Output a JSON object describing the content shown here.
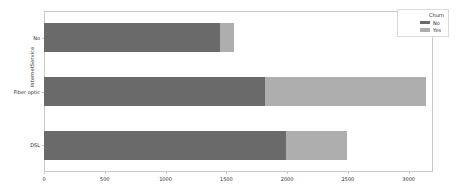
{
  "chart_data": {
    "type": "bar",
    "orientation": "horizontal",
    "stacked": true,
    "title": "",
    "xlabel": "",
    "ylabel": "InternetService",
    "categories": [
      "No",
      "Fiber optic",
      "DSL"
    ],
    "series": [
      {
        "name": "No",
        "color": "#6a6a6a",
        "values": [
          1447,
          1816,
          1987
        ]
      },
      {
        "name": "Yes",
        "color": "#aeaeae",
        "values": [
          115,
          1324,
          507
        ]
      }
    ],
    "totals": [
      1562,
      3140,
      2494
    ],
    "xlim": [
      0,
      3200
    ],
    "ylim": [
      0,
      3
    ],
    "xticks": [
      0,
      500,
      1000,
      1500,
      2000,
      2500,
      3000
    ],
    "xtick_labels": [
      "0",
      "500",
      "1000",
      "1500",
      "2000",
      "2500",
      "3000"
    ],
    "grid": false,
    "legend": {
      "title": "Churn",
      "position": "upper right",
      "entries": [
        {
          "label": "No",
          "color": "#6a6a6a"
        },
        {
          "label": "Yes",
          "color": "#aeaeae"
        }
      ]
    },
    "axis_color": "#c9c9c9",
    "text_color": "#2b2b2b",
    "background": "#ffffff"
  }
}
